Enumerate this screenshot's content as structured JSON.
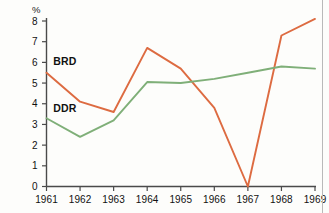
{
  "chart_data": {
    "type": "line",
    "title": "",
    "subtitle": "",
    "xlabel": "",
    "ylabel": "%",
    "x": [
      1961,
      1962,
      1963,
      1964,
      1965,
      1966,
      1967,
      1968,
      1969
    ],
    "categories": [
      "1961",
      "1962",
      "1963",
      "1964",
      "1965",
      "1966",
      "1967",
      "1968",
      "1969"
    ],
    "xlim": [
      1961,
      1969
    ],
    "ylim": [
      0,
      8
    ],
    "ytick_labels": [
      "0",
      "1",
      "2",
      "3",
      "4",
      "5",
      "6",
      "7",
      "8"
    ],
    "ytick_values": [
      0,
      1,
      2,
      3,
      4,
      5,
      6,
      7,
      8
    ],
    "grid": false,
    "legend_position": "inline-annotation",
    "series": [
      {
        "name": "BRD",
        "color": "#dd6b41",
        "values": [
          5.5,
          4.1,
          3.6,
          6.7,
          5.7,
          3.8,
          0.0,
          7.3,
          8.1
        ]
      },
      {
        "name": "DDR",
        "color": "#7faf78",
        "values": [
          3.3,
          2.4,
          3.2,
          5.05,
          5.0,
          5.2,
          5.5,
          5.8,
          5.7
        ]
      }
    ],
    "annotations": [
      {
        "text": "BRD",
        "x": 1961.2,
        "y": 6.05
      },
      {
        "text": "DDR",
        "x": 1961.2,
        "y": 3.75
      }
    ]
  },
  "axis": {
    "y_unit_label": "%"
  }
}
